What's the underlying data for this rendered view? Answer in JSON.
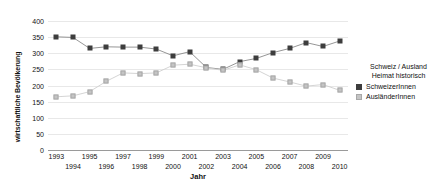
{
  "chart_data": {
    "type": "line",
    "title": "",
    "xlabel": "Jahr",
    "ylabel": "wirtschaftliche Bevölkerung",
    "ylim": [
      0,
      400
    ],
    "yticks": [
      0,
      50,
      100,
      150,
      200,
      250,
      300,
      350,
      400
    ],
    "grid": true,
    "legend_position": "right",
    "legend_title": [
      "Schweiz / Ausland",
      "Heimat historisch"
    ],
    "categories": [
      "1993",
      "1994",
      "1995",
      "1996",
      "1997",
      "1998",
      "1999",
      "2000",
      "2001",
      "2002",
      "2003",
      "2004",
      "2005",
      "2006",
      "2007",
      "2008",
      "2009",
      "2010"
    ],
    "series": [
      {
        "name": "SchweizerInnen",
        "color": "#3d3d3d",
        "marker": "square-filled",
        "values": [
          351,
          349,
          315,
          320,
          319,
          319,
          313,
          292,
          305,
          256,
          250,
          274,
          284,
          302,
          315,
          333,
          321,
          338
        ]
      },
      {
        "name": "AusländerInnen",
        "color": "#c4c4c4",
        "marker": "square-light",
        "values": [
          165,
          168,
          181,
          213,
          239,
          237,
          239,
          263,
          266,
          255,
          247,
          264,
          249,
          223,
          211,
          198,
          203,
          185
        ]
      }
    ]
  }
}
